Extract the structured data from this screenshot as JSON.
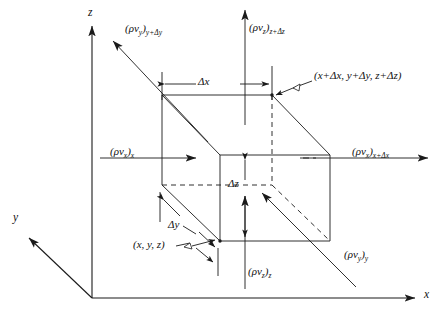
{
  "figure": {
    "stroke_color": "#1a1a1a",
    "background": "#ffffff"
  },
  "axes": [
    {
      "name": "z-axis",
      "label": "z",
      "direction": "up"
    },
    {
      "name": "x-axis",
      "label": "x",
      "direction": "right"
    },
    {
      "name": "y-axis",
      "label": "y",
      "direction": "lower-left"
    }
  ],
  "flux_labels": [
    {
      "name": "flux-y-plus-dy",
      "base": "(ρv",
      "sub": "y",
      "post": ")",
      "at": "y+Δy"
    },
    {
      "name": "flux-z-plus-dz",
      "base": "(ρv",
      "sub": "z",
      "post": ")",
      "at": "z+Δz"
    },
    {
      "name": "flux-x",
      "base": "(ρv",
      "sub": "x",
      "post": ")",
      "at": "x"
    },
    {
      "name": "flux-x-plus-dx",
      "base": "(ρv",
      "sub": "x",
      "post": ")",
      "at": "x+Δx"
    },
    {
      "name": "flux-z",
      "base": "(ρv",
      "sub": "z",
      "post": ")",
      "at": "z"
    },
    {
      "name": "flux-y",
      "base": "(ρv",
      "sub": "y",
      "post": ")",
      "at": "y"
    }
  ],
  "text": {
    "flux_y_plus_dy_main": "(ρv",
    "flux_y_plus_dy_sub1": "y",
    "flux_y_plus_dy_sub2": "y+Δy",
    "flux_z_plus_dz_sub2": "z+Δz",
    "flux_x_sub2": "x",
    "flux_x_plus_dx_sub2": "x+Δx",
    "flux_z_sub2": "z",
    "flux_y_sub2": "y",
    "sub_x": "x",
    "sub_y": "y",
    "sub_z": "z",
    "paren_close": ")",
    "corner_far": "(x+Δx, y+Δy, z+Δz)",
    "corner_near": "(x, y, z)",
    "delta_x": "Δx",
    "delta_y": "Δy",
    "delta_z": "Δz",
    "axis_x": "x",
    "axis_y": "y",
    "axis_z": "z"
  }
}
